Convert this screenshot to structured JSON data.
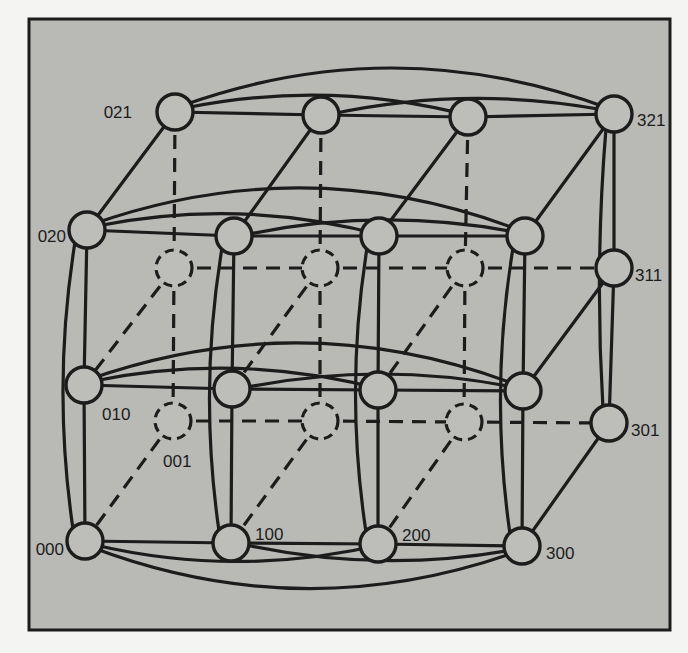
{
  "diagram": {
    "type": "3D processor grid / generalized hypercube network",
    "frame": {
      "x": 29,
      "y": 19,
      "w": 641,
      "h": 611,
      "fill": "#b9b9b6",
      "stroke": "#1c1c1c"
    },
    "node_radius": 18,
    "nodes": [
      {
        "id": "021",
        "x": 175,
        "y": 112,
        "hidden": false,
        "label": "021",
        "lx": 132,
        "ly": 112,
        "anchor": "end"
      },
      {
        "id": "121",
        "x": 321,
        "y": 115,
        "hidden": false,
        "label": ""
      },
      {
        "id": "221",
        "x": 468,
        "y": 117,
        "hidden": false,
        "label": ""
      },
      {
        "id": "321",
        "x": 614,
        "y": 114,
        "hidden": false,
        "label": "321",
        "lx": 637,
        "ly": 120,
        "anchor": "start"
      },
      {
        "id": "020",
        "x": 87,
        "y": 230,
        "hidden": false,
        "label": "020",
        "lx": 66,
        "ly": 236,
        "anchor": "end"
      },
      {
        "id": "120",
        "x": 234,
        "y": 236,
        "hidden": false,
        "label": ""
      },
      {
        "id": "220",
        "x": 379,
        "y": 236,
        "hidden": false,
        "label": ""
      },
      {
        "id": "320",
        "x": 525,
        "y": 236,
        "hidden": false,
        "label": ""
      },
      {
        "id": "011",
        "x": 174,
        "y": 268,
        "hidden": true,
        "label": ""
      },
      {
        "id": "111",
        "x": 320,
        "y": 268,
        "hidden": true,
        "label": ""
      },
      {
        "id": "211",
        "x": 465,
        "y": 268,
        "hidden": true,
        "label": ""
      },
      {
        "id": "311",
        "x": 614,
        "y": 268,
        "hidden": false,
        "label": "311",
        "lx": 635,
        "ly": 275,
        "anchor": "start"
      },
      {
        "id": "010",
        "x": 84,
        "y": 385,
        "hidden": false,
        "label": "010",
        "lx": 102,
        "ly": 414,
        "anchor": "start"
      },
      {
        "id": "110",
        "x": 232,
        "y": 389,
        "hidden": false,
        "label": ""
      },
      {
        "id": "210",
        "x": 378,
        "y": 390,
        "hidden": false,
        "label": ""
      },
      {
        "id": "310",
        "x": 523,
        "y": 391,
        "hidden": false,
        "label": ""
      },
      {
        "id": "001",
        "x": 173,
        "y": 421,
        "hidden": true,
        "label": "001",
        "lx": 163,
        "ly": 461,
        "anchor": "start"
      },
      {
        "id": "101",
        "x": 320,
        "y": 421,
        "hidden": true,
        "label": ""
      },
      {
        "id": "201",
        "x": 464,
        "y": 422,
        "hidden": true,
        "label": ""
      },
      {
        "id": "301",
        "x": 609,
        "y": 423,
        "hidden": false,
        "label": "301",
        "lx": 631,
        "ly": 430,
        "anchor": "start"
      },
      {
        "id": "000",
        "x": 85,
        "y": 541,
        "hidden": false,
        "label": "000",
        "lx": 64,
        "ly": 549,
        "anchor": "end"
      },
      {
        "id": "100",
        "x": 231,
        "y": 543,
        "hidden": false,
        "label": "100",
        "lx": 255,
        "ly": 534,
        "anchor": "start"
      },
      {
        "id": "200",
        "x": 378,
        "y": 544,
        "hidden": false,
        "label": "200",
        "lx": 402,
        "ly": 535,
        "anchor": "start"
      },
      {
        "id": "300",
        "x": 522,
        "y": 546,
        "hidden": false,
        "label": "300",
        "lx": 546,
        "ly": 553,
        "anchor": "start"
      }
    ],
    "rows_front": [
      [
        "021",
        "121",
        "221",
        "321"
      ],
      [
        "020",
        "120",
        "220",
        "320"
      ],
      [
        "010",
        "110",
        "210",
        "310"
      ],
      [
        "000",
        "100",
        "200",
        "300"
      ]
    ],
    "rows_back_hidden": [
      [
        "011",
        "111",
        "211",
        "311"
      ],
      [
        "001",
        "101",
        "201",
        "301"
      ]
    ],
    "legend": {
      "solid_circle": "visible processor node",
      "dashed_circle": "hidden (rear) processor node",
      "solid_line": "visible link",
      "dashed_line": "hidden link"
    }
  }
}
